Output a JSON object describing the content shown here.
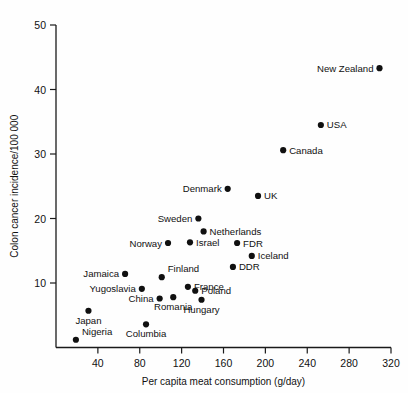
{
  "chart_data": {
    "type": "scatter",
    "title": "",
    "xlabel": "Per capita meat consumption (g/day)",
    "ylabel": "Colon cancer incidence/100 000",
    "xlim": [
      0,
      320
    ],
    "ylim": [
      0,
      50
    ],
    "xticks": [
      40,
      80,
      120,
      160,
      200,
      240,
      280,
      320
    ],
    "yticks": [
      10,
      20,
      30,
      40,
      50
    ],
    "grid": false,
    "legend": false,
    "points": [
      {
        "label": "New Zealand",
        "x": 309,
        "y": 43.3,
        "label_pos": "left"
      },
      {
        "label": "USA",
        "x": 253,
        "y": 34.5,
        "label_pos": "right"
      },
      {
        "label": "Canada",
        "x": 217,
        "y": 30.6,
        "label_pos": "right"
      },
      {
        "label": "Denmark",
        "x": 164,
        "y": 24.6,
        "label_pos": "left"
      },
      {
        "label": "UK",
        "x": 193,
        "y": 23.5,
        "label_pos": "right"
      },
      {
        "label": "Sweden",
        "x": 136,
        "y": 20.0,
        "label_pos": "left"
      },
      {
        "label": "Netherlands",
        "x": 141,
        "y": 18.0,
        "label_pos": "right"
      },
      {
        "label": "FDR",
        "x": 173,
        "y": 16.2,
        "label_pos": "right"
      },
      {
        "label": "Norway",
        "x": 107,
        "y": 16.2,
        "label_pos": "left"
      },
      {
        "label": "Israel",
        "x": 128,
        "y": 16.3,
        "label_pos": "right"
      },
      {
        "label": "Iceland",
        "x": 187,
        "y": 14.2,
        "label_pos": "right"
      },
      {
        "label": "DDR",
        "x": 169,
        "y": 12.5,
        "label_pos": "right"
      },
      {
        "label": "Jamaica",
        "x": 66,
        "y": 11.4,
        "label_pos": "left"
      },
      {
        "label": "Finland",
        "x": 101,
        "y": 10.9,
        "label_pos": "above"
      },
      {
        "label": "France",
        "x": 126,
        "y": 9.4,
        "label_pos": "right"
      },
      {
        "label": "Yugoslavia",
        "x": 82,
        "y": 9.1,
        "label_pos": "left"
      },
      {
        "label": "Poland",
        "x": 133,
        "y": 8.8,
        "label_pos": "right"
      },
      {
        "label": "China",
        "x": 99,
        "y": 7.6,
        "label_pos": "left"
      },
      {
        "label": "Romania",
        "x": 112,
        "y": 7.8,
        "label_pos": "below"
      },
      {
        "label": "Hungary",
        "x": 139,
        "y": 7.4,
        "label_pos": "below"
      },
      {
        "label": "Japan",
        "x": 31,
        "y": 5.7,
        "label_pos": "below"
      },
      {
        "label": "Columbia",
        "x": 86,
        "y": 3.6,
        "label_pos": "below"
      },
      {
        "label": "Nigeria",
        "x": 19,
        "y": 1.2,
        "label_pos": "above"
      }
    ]
  }
}
